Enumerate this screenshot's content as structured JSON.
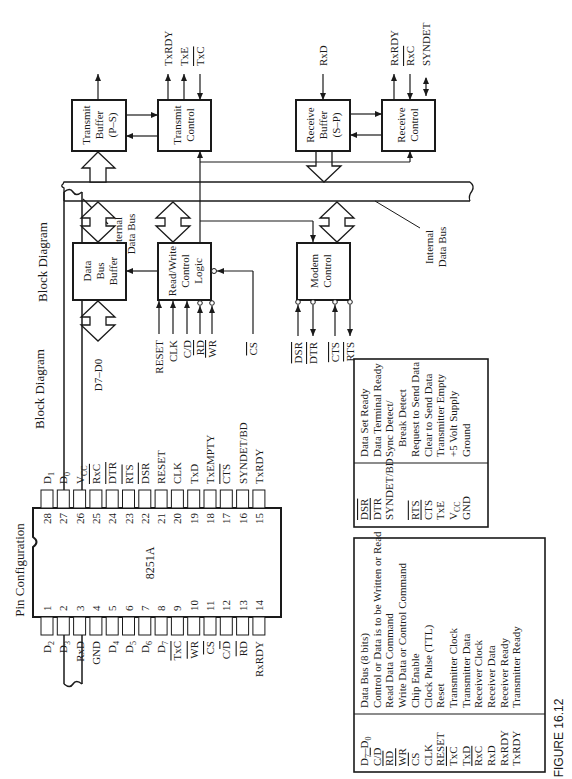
{
  "figure_label": "FIGURE 16.12",
  "block_diagram": {
    "title": "Block Diagram",
    "internal_bus_label": [
      "Internal",
      "Data Bus"
    ],
    "blocks": {
      "transmit_buffer": [
        "Transmit",
        "Buffer",
        "(P–S)"
      ],
      "transmit_control": [
        "Transmit",
        "Control"
      ],
      "receive_buffer": [
        "Receive",
        "Buffer",
        "(S–P)"
      ],
      "receive_control": [
        "Receive",
        "Control"
      ],
      "data_bus_buffer": [
        "Data",
        "Bus",
        "Buffer"
      ],
      "rw_control_logic": [
        "Read/Write",
        "Control",
        "Logic"
      ],
      "modem_control": [
        "Modem",
        "Control"
      ]
    },
    "signals": {
      "transmit_control": [
        "TxRDY",
        "TxE",
        "TxC"
      ],
      "receive_buffer_in": "RxD",
      "receive_control": [
        "RxRDY",
        "RxC",
        "SYNDET"
      ],
      "data_bus": "D7–D0",
      "rw_inputs": [
        "RESET",
        "CLK",
        "C/D",
        "RD",
        "WR"
      ],
      "chip_select": "CS",
      "modem": [
        "DSR",
        "DTR",
        "CTS",
        "RTS"
      ]
    }
  },
  "pin_configuration": {
    "title": "Pin Configuration",
    "chip_label": "8251A",
    "left_pins": [
      {
        "num": "1",
        "name": "D2"
      },
      {
        "num": "2",
        "name": "D3"
      },
      {
        "num": "3",
        "name": "RxD"
      },
      {
        "num": "4",
        "name": "GND"
      },
      {
        "num": "5",
        "name": "D4"
      },
      {
        "num": "6",
        "name": "D5"
      },
      {
        "num": "7",
        "name": "D6"
      },
      {
        "num": "8",
        "name": "D7"
      },
      {
        "num": "9",
        "name": "TxC"
      },
      {
        "num": "10",
        "name": "WR"
      },
      {
        "num": "11",
        "name": "CS"
      },
      {
        "num": "12",
        "name": "C/D"
      },
      {
        "num": "13",
        "name": "RD"
      },
      {
        "num": "14",
        "name": "RxRDY"
      }
    ],
    "right_pins": [
      {
        "num": "28",
        "name": "D1"
      },
      {
        "num": "27",
        "name": "D0"
      },
      {
        "num": "26",
        "name": "VCC"
      },
      {
        "num": "25",
        "name": "RxC"
      },
      {
        "num": "24",
        "name": "DTR"
      },
      {
        "num": "23",
        "name": "RTS"
      },
      {
        "num": "22",
        "name": "DSR"
      },
      {
        "num": "21",
        "name": "RESET"
      },
      {
        "num": "20",
        "name": "CLK"
      },
      {
        "num": "19",
        "name": "TxD"
      },
      {
        "num": "18",
        "name": "TxEMPTY"
      },
      {
        "num": "17",
        "name": "CTS"
      },
      {
        "num": "16",
        "name": "SYNDET/BD"
      },
      {
        "num": "15",
        "name": "TxRDY"
      }
    ]
  },
  "pin_names": {
    "title": "Pin Names",
    "left_table": [
      {
        "pin": "D7–D0",
        "desc": "Data Bus (8 bits)"
      },
      {
        "pin": "C/D",
        "desc": "Control or Data is to be Written or Read"
      },
      {
        "pin": "RD",
        "desc": "Read Data Command"
      },
      {
        "pin": "WR",
        "desc": "Write Data or Control Command"
      },
      {
        "pin": "CS",
        "desc": "Chip Enable"
      },
      {
        "pin": "CLK",
        "desc": "Clock Pulse (TTL)"
      },
      {
        "pin": "RESET",
        "desc": "Reset"
      },
      {
        "pin": "TxC",
        "desc": "Transmitter Clock"
      },
      {
        "pin": "TxD",
        "desc": "Transmitter Data"
      },
      {
        "pin": "RxC",
        "desc": "Receiver Clock"
      },
      {
        "pin": "RxD",
        "desc": "Receiver Data"
      },
      {
        "pin": "RxRDY",
        "desc": "Receiver Ready"
      },
      {
        "pin": "TxRDY",
        "desc": "Transmitter Ready"
      }
    ],
    "right_table": [
      {
        "pin": "DSR",
        "desc": "Data Set Ready"
      },
      {
        "pin": "DTR",
        "desc": "Data Terminal Ready"
      },
      {
        "pin": "SYNDET/BD",
        "desc": "Sync Detect/"
      },
      {
        "pin": "",
        "desc": "Break Detect"
      },
      {
        "pin": "RTS",
        "desc": "Request to Send Data"
      },
      {
        "pin": "CTS",
        "desc": "Clear to Send Data"
      },
      {
        "pin": "TxE",
        "desc": "Transmitter Empty"
      },
      {
        "pin": "VCC",
        "desc": "+5 Volt Supply"
      },
      {
        "pin": "GND",
        "desc": "Ground"
      }
    ]
  }
}
